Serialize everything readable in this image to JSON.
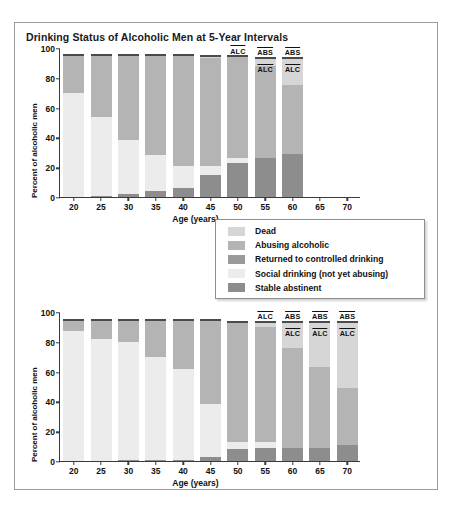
{
  "figure": {
    "title": "Drinking Status of Alcoholic Men at 5-Year Intervals"
  },
  "legend": {
    "items": [
      {
        "label": "Dead",
        "color": "#d6d6d6"
      },
      {
        "label": "Abusing alcoholic",
        "color": "#b4b4b4"
      },
      {
        "label": "Returned to controlled drinking",
        "color": "#9a9a9a"
      },
      {
        "label": "Social drinking (not yet abusing)",
        "color": "#ececec"
      },
      {
        "label": "Stable abstinent",
        "color": "#8d8d8d"
      }
    ]
  },
  "chart_data": [
    {
      "type": "bar",
      "id": "top-chart",
      "stacked": true,
      "title": "",
      "xlabel": "Age (years)",
      "ylabel": "Percent of alcoholic men",
      "categories": [
        "20",
        "25",
        "30",
        "35",
        "40",
        "45",
        "50",
        "55",
        "60",
        "65",
        "70"
      ],
      "ylim": [
        0,
        100
      ],
      "yticks": [
        0,
        20,
        40,
        60,
        80,
        100
      ],
      "grid": false,
      "legend_position": "center-right",
      "series": [
        {
          "name": "Stable abstinent",
          "color": "#8d8d8d",
          "values": [
            0,
            1,
            2,
            4,
            6,
            15,
            23,
            26,
            29,
            null,
            null
          ]
        },
        {
          "name": "Social drinking (not yet abusing)",
          "color": "#ececec",
          "values": [
            70,
            53,
            36,
            24,
            15,
            6,
            3,
            0,
            0,
            null,
            null
          ]
        },
        {
          "name": "Returned to controlled drinking",
          "color": "#9a9a9a",
          "values": [
            0,
            0,
            0,
            0,
            0,
            0,
            0,
            0,
            0,
            null,
            null
          ]
        },
        {
          "name": "Abusing alcoholic",
          "color": "#b4b4b4",
          "values": [
            26,
            42,
            58,
            68,
            75,
            72,
            69,
            62,
            46,
            null,
            null
          ]
        },
        {
          "name": "Dead",
          "color": "#d6d6d6",
          "values": [
            0,
            0,
            0,
            0,
            0,
            2,
            0,
            6,
            19,
            null,
            null
          ]
        }
      ],
      "bar_totals": [
        96,
        96,
        96,
        96,
        96,
        95,
        95,
        94,
        94,
        null,
        null
      ],
      "annotations": [
        {
          "category": "50",
          "labels": [
            "ALC"
          ]
        },
        {
          "category": "55",
          "labels": [
            "ABS",
            "ALC"
          ]
        },
        {
          "category": "60",
          "labels": [
            "ABS",
            "ALC"
          ]
        }
      ]
    },
    {
      "type": "bar",
      "id": "bottom-chart",
      "stacked": true,
      "title": "",
      "xlabel": "Age (years)",
      "ylabel": "Percent of alcoholic men",
      "categories": [
        "20",
        "25",
        "30",
        "35",
        "40",
        "45",
        "50",
        "55",
        "60",
        "65",
        "70"
      ],
      "ylim": [
        0,
        100
      ],
      "yticks": [
        0,
        20,
        40,
        60,
        80,
        100
      ],
      "grid": false,
      "series": [
        {
          "name": "Stable abstinent",
          "color": "#8d8d8d",
          "values": [
            0,
            0,
            1,
            1,
            1,
            3,
            8,
            9,
            9,
            9,
            11
          ]
        },
        {
          "name": "Social drinking (not yet abusing)",
          "color": "#ececec",
          "values": [
            87,
            82,
            79,
            69,
            61,
            35,
            5,
            4,
            0,
            0,
            0
          ]
        },
        {
          "name": "Returned to controlled drinking",
          "color": "#9a9a9a",
          "values": [
            0,
            0,
            0,
            0,
            0,
            0,
            0,
            0,
            0,
            0,
            0
          ]
        },
        {
          "name": "Abusing alcoholic",
          "color": "#b4b4b4",
          "values": [
            8,
            13,
            15,
            25,
            33,
            57,
            81,
            77,
            67,
            54,
            38
          ]
        },
        {
          "name": "Dead",
          "color": "#d6d6d6",
          "values": [
            0,
            0,
            0,
            0,
            0,
            0,
            0,
            4,
            18,
            31,
            45
          ]
        }
      ],
      "bar_totals": [
        95,
        95,
        95,
        95,
        95,
        95,
        94,
        94,
        94,
        94,
        94
      ],
      "annotations": [
        {
          "category": "55",
          "labels": [
            "ALC"
          ]
        },
        {
          "category": "60",
          "labels": [
            "ABS",
            "ALC"
          ]
        },
        {
          "category": "65",
          "labels": [
            "ABS",
            "ALC"
          ]
        },
        {
          "category": "70",
          "labels": [
            "ABS",
            "ALC"
          ]
        }
      ]
    }
  ]
}
